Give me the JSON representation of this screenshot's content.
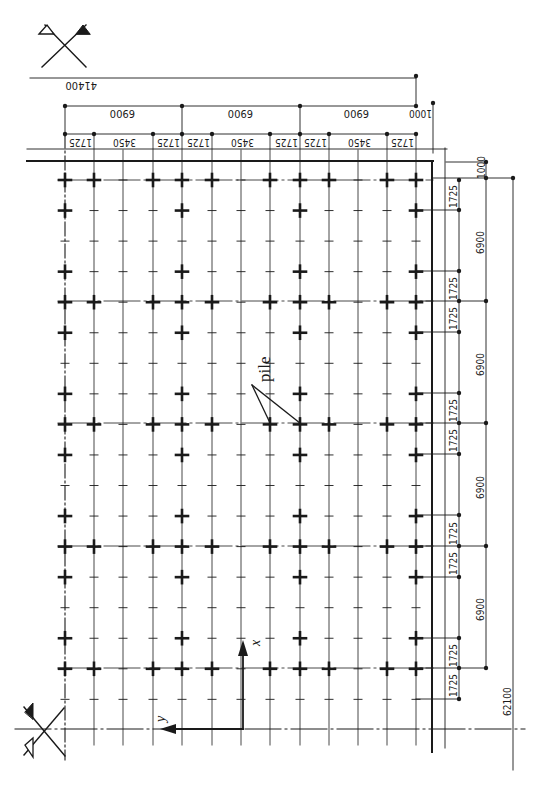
{
  "drawing": {
    "title": "Pile foundation layout plan",
    "colors": {
      "ink": "#1a1a1a",
      "paper": "#ffffff"
    },
    "annotations": {
      "pile_label": "pile",
      "axis_x_label": "x",
      "axis_y_label": "y"
    },
    "top_dimensions": {
      "overall": "41400",
      "bays": [
        "6900",
        "6900",
        "6900",
        "1000"
      ],
      "sub_spacings": [
        "1725",
        "3450",
        "1725",
        "1725",
        "3450",
        "1725",
        "1725",
        "3450",
        "1725"
      ]
    },
    "right_dimensions": {
      "overall": "62100",
      "offset": "1000",
      "bays": [
        "6900",
        "6900",
        "6900",
        "6900"
      ],
      "sub_spacings": [
        "1725",
        "1725",
        "1725",
        "1725",
        "1725",
        "1725",
        "1725",
        "1725",
        "1725"
      ]
    },
    "symbols": {
      "top_left": "cut-section-marker",
      "bottom_left": "cut-section-marker"
    }
  }
}
